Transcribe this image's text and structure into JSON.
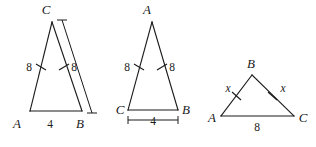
{
  "figure": {
    "background_color": "#ffffff",
    "stroke_color": "#1a1a1a",
    "figures": [
      {
        "id": "triangle-1",
        "apex_label": "C",
        "left_vertex_label": "A",
        "right_vertex_label": "B",
        "left_side_length": "8",
        "right_side_length": "8",
        "base_length": "4",
        "left_side_ticks": 1,
        "right_side_ticks": 1,
        "has_side_extension_line": true
      },
      {
        "id": "triangle-2",
        "apex_label": "A",
        "left_vertex_label": "C",
        "right_vertex_label": "B",
        "left_side_length": "8",
        "right_side_length": "8",
        "base_length": "4",
        "left_side_ticks": 1,
        "right_side_ticks": 1,
        "has_base_dimension_line": true
      },
      {
        "id": "triangle-3",
        "apex_label": "B",
        "left_vertex_label": "A",
        "right_vertex_label": "C",
        "left_side_length": "x",
        "right_side_length": "x",
        "base_length": "8",
        "left_side_ticks": 1,
        "right_side_ticks": 1
      }
    ]
  }
}
